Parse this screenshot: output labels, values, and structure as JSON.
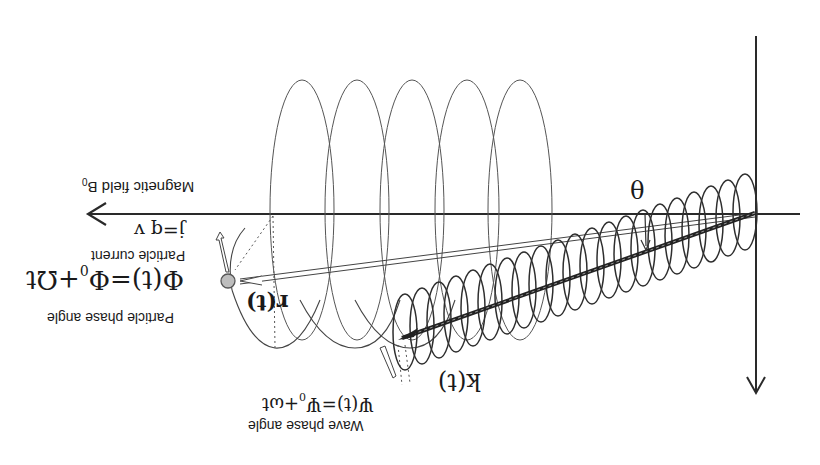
{
  "diagram": {
    "orientation": "rotated 180 degrees",
    "labels": {
      "magnetic_field": "Magnetic field B",
      "magnetic_field_sub": "0",
      "particle_current_title": "Particle current",
      "particle_current_eq": "j=q v",
      "particle_phase_title": "Particle phase angle",
      "particle_phase_eq": "Φ(t)=Φ",
      "particle_phase_sub": "0",
      "particle_phase_tail": "+Ωt",
      "radius": "r(t)",
      "wave_phase_title": "Wave phase angle",
      "wave_phase_eq": "Ψ(t)=Ψ",
      "wave_phase_sub": "0",
      "wave_phase_tail": "+ωt",
      "wave_vector": "k(t)",
      "angle": "θ"
    },
    "colors": {
      "line": "#2a2a2a",
      "particle_fill": "#bdbdbd",
      "background": "#ffffff"
    }
  }
}
